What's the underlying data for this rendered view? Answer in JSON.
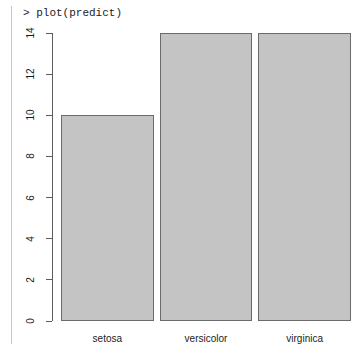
{
  "console": {
    "prompt_line": "> plot(predict)"
  },
  "chart_data": {
    "type": "bar",
    "title": "",
    "xlabel": "",
    "ylabel": "",
    "categories": [
      "setosa",
      "versicolor",
      "virginica"
    ],
    "values": [
      10,
      14,
      14
    ],
    "ylim": [
      0,
      14
    ],
    "y_ticks": [
      0,
      2,
      4,
      6,
      8,
      10,
      12,
      14
    ],
    "y_tick_labels": [
      "0",
      "2",
      "4",
      "6",
      "8",
      "10",
      "12",
      "14"
    ],
    "grid": false,
    "legend": null,
    "bar_fill_color": "#c4c4c4",
    "bar_border_color": "#6b6b6b",
    "background_color": "#ffffff",
    "axis_color": "#5d5d5d",
    "text_color": "#1b1b1b"
  }
}
